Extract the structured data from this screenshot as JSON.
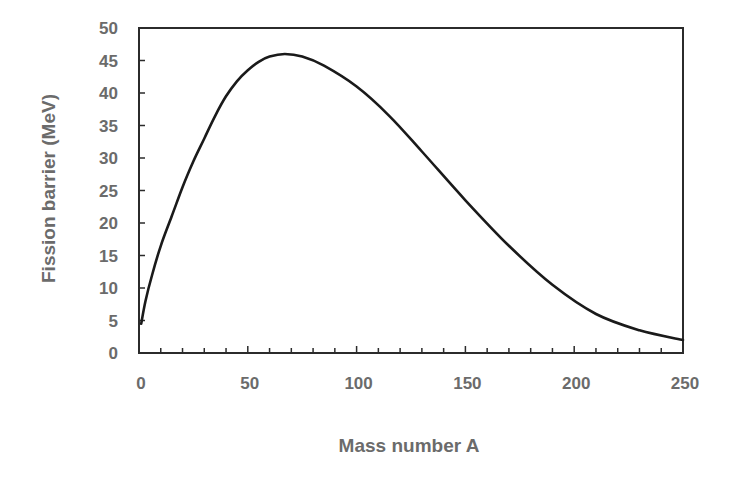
{
  "chart_data": {
    "type": "line",
    "title": "",
    "xlabel": "Mass number A",
    "ylabel": "Fission barrier (MeV)",
    "xlim": [
      0,
      250
    ],
    "ylim": [
      0,
      50
    ],
    "x_ticks": [
      0,
      50,
      100,
      150,
      200,
      250
    ],
    "y_ticks": [
      0,
      5,
      10,
      15,
      20,
      25,
      30,
      35,
      40,
      45,
      50
    ],
    "x_minor_step": 10,
    "grid": false,
    "legend": null,
    "series": [
      {
        "name": "Fission barrier",
        "color": "#1a1a1a",
        "x": [
          1,
          3,
          6,
          10,
          15,
          20,
          25,
          30,
          35,
          40,
          45,
          50,
          55,
          60,
          67,
          75,
          85,
          100,
          115,
          130,
          150,
          170,
          190,
          210,
          230,
          250
        ],
        "y": [
          4.5,
          8,
          12,
          16.5,
          21,
          25.5,
          29.5,
          33,
          36.5,
          39.5,
          41.8,
          43.5,
          44.8,
          45.6,
          46,
          45.6,
          44.2,
          41,
          36.5,
          31,
          23.5,
          16.5,
          10.5,
          6,
          3.5,
          2
        ]
      }
    ]
  },
  "axes": {
    "xlabel": "Mass number A",
    "ylabel": "Fission barrier (MeV)"
  }
}
